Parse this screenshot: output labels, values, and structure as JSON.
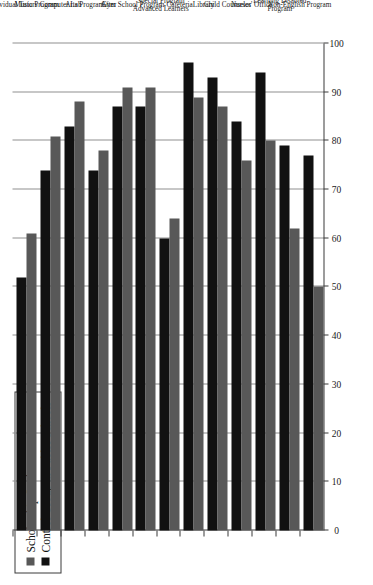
{
  "chart_data": {
    "type": "bar",
    "orientation": "horizontal",
    "title": "",
    "xlabel": "",
    "ylabel": "",
    "xlim": [
      0,
      100
    ],
    "grid": true,
    "legend_position": "top-left",
    "tick_labels": [
      "0",
      "10",
      "20",
      "30",
      "40",
      "50",
      "60",
      "70",
      "80",
      "90",
      "100"
    ],
    "tick_values": [
      0,
      10,
      20,
      30,
      40,
      50,
      60,
      70,
      80,
      90,
      100
    ],
    "categories": [
      "Non-English Program",
      "Learning Disabled Program",
      "Nurses' Office",
      "Child Counselor",
      "Library",
      "Cafeteria",
      "Special Program Advanced Learners",
      "After School Program",
      "Gym",
      "Arts Program",
      "Computer Lab",
      "Music Program",
      "Individual Tutors"
    ],
    "series": [
      {
        "name": "Scholarship Students",
        "color": "#585858",
        "values": [
          50,
          62,
          80,
          76,
          87,
          89,
          64,
          91,
          91,
          78,
          88,
          81,
          61
        ]
      },
      {
        "name": "Control Group in Public Schools",
        "color": "#111111",
        "values": [
          77,
          79,
          94,
          84,
          93,
          96,
          60,
          87,
          87,
          74,
          83,
          74,
          52
        ]
      }
    ]
  },
  "legend": {
    "items": [
      {
        "label": "Scholarship Students",
        "swatch": "gray"
      },
      {
        "label": "Control Group in Public Schools",
        "swatch": "black"
      }
    ]
  }
}
